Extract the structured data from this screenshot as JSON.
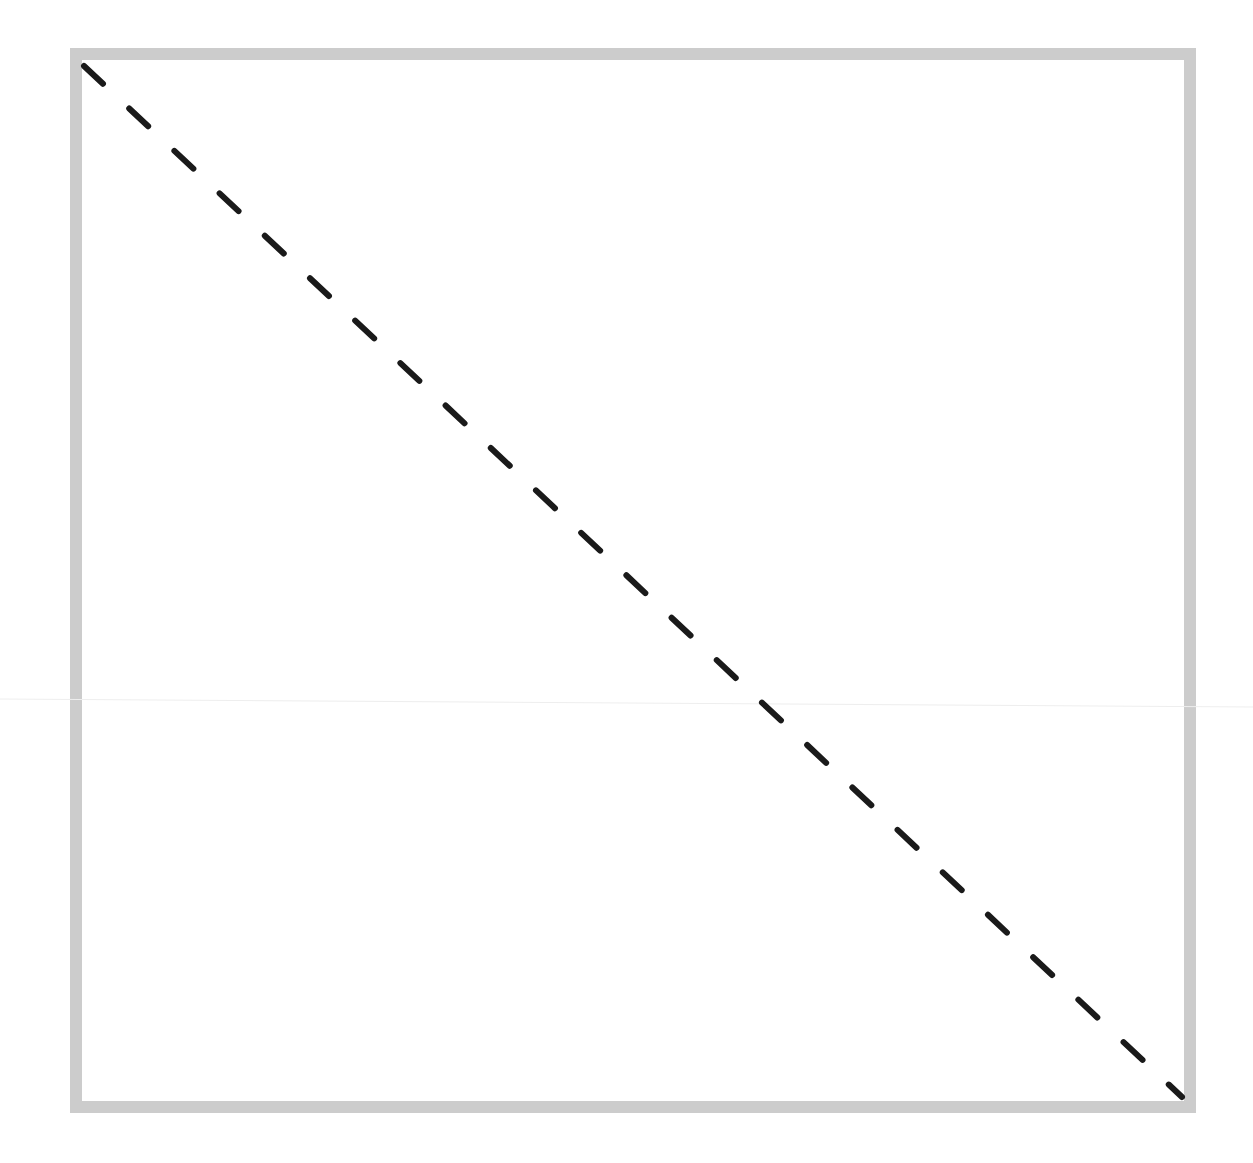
{
  "diagram": {
    "type": "image-placeholder",
    "frame": {
      "border_color": "#cccccc",
      "fill_color": "#ffffff"
    },
    "diagonal": {
      "style": "dashed",
      "color": "#1a1a1a",
      "direction": "top-left-to-bottom-right"
    },
    "faint_guide_line": {
      "color": "#eeeeee"
    }
  }
}
